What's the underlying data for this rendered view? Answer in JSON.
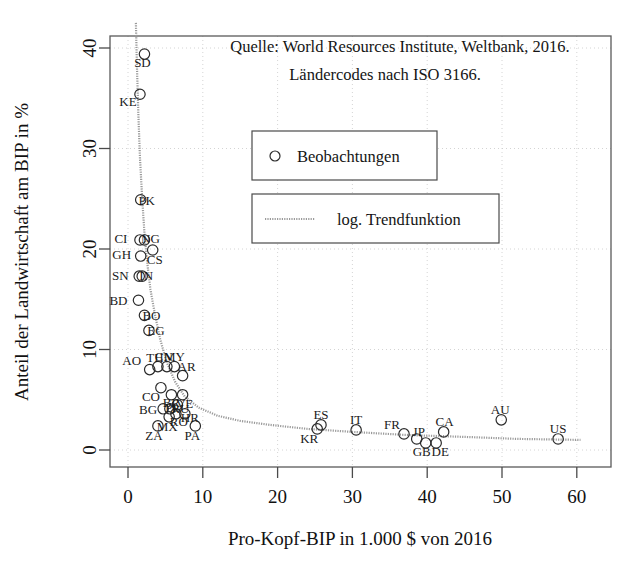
{
  "chart_data": {
    "type": "scatter",
    "title": "",
    "xlabel": "Pro-Kopf-BIP in 1.000 $ von 2016",
    "ylabel": "Anteil der Landwirtschaft am BIP in %",
    "xlim": [
      -1.5,
      62.5
    ],
    "ylim": [
      -2.5,
      42.5
    ],
    "xticks": [
      0,
      10,
      20,
      30,
      40,
      50,
      60
    ],
    "yticks": [
      0,
      10,
      20,
      30,
      40
    ],
    "grid": true,
    "legend_position": "upper-center",
    "annotations": [
      "Quelle: World Resources Institute, Weltbank, 2016.",
      "Ländercodes nach ISO 3166."
    ],
    "legend": [
      {
        "label": "Beobachtungen",
        "marker": "circle"
      },
      {
        "label": "log. Trendfunktion",
        "marker": "line"
      }
    ],
    "series": [
      {
        "name": "Beobachtungen",
        "points": [
          {
            "code": "SD",
            "x": 2.2,
            "y": 39.4,
            "lx": -2,
            "ly": 13
          },
          {
            "code": "KE",
            "x": 1.6,
            "y": 35.4,
            "lx": -12,
            "ly": 12
          },
          {
            "code": "PK",
            "x": 1.7,
            "y": 24.9,
            "lx": 6,
            "ly": 5
          },
          {
            "code": "CI",
            "x": 1.6,
            "y": 20.9,
            "lx": -19,
            "ly": 3
          },
          {
            "code": "NG",
            "x": 2.2,
            "y": 20.9,
            "lx": 6,
            "ly": 3
          },
          {
            "code": "CS",
            "x": 3.3,
            "y": 19.9,
            "lx": 2,
            "ly": 14
          },
          {
            "code": "GH",
            "x": 1.7,
            "y": 19.3,
            "lx": -19,
            "ly": 3
          },
          {
            "code": "SN",
            "x": 1.5,
            "y": 17.3,
            "lx": -19,
            "ly": 4
          },
          {
            "code": "IN",
            "x": 1.9,
            "y": 17.3,
            "lx": 4,
            "ly": 4
          },
          {
            "code": "BD",
            "x": 1.4,
            "y": 14.9,
            "lx": -20,
            "ly": 5
          },
          {
            "code": "BO",
            "x": 2.2,
            "y": 13.4,
            "lx": 7,
            "ly": 5
          },
          {
            "code": "EG",
            "x": 2.8,
            "y": 11.9,
            "lx": 7,
            "ly": 5
          },
          {
            "code": "AO",
            "x": 2.9,
            "y": 8.0,
            "lx": -18,
            "ly": -5
          },
          {
            "code": "TH",
            "x": 4.0,
            "y": 8.3,
            "lx": -3,
            "ly": -5
          },
          {
            "code": "CN",
            "x": 5.2,
            "y": 8.3,
            "lx": -3,
            "ly": -6
          },
          {
            "code": "MY",
            "x": 6.2,
            "y": 8.3,
            "lx": 0,
            "ly": -6
          },
          {
            "code": "AR",
            "x": 7.3,
            "y": 7.4,
            "lx": 4,
            "ly": -5
          },
          {
            "code": "CO",
            "x": 4.4,
            "y": 6.2,
            "lx": -10,
            "ly": 13
          },
          {
            "code": "BR",
            "x": 5.8,
            "y": 5.5,
            "lx": 0,
            "ly": 12
          },
          {
            "code": "VE",
            "x": 7.3,
            "y": 5.5,
            "lx": 2,
            "ly": 13
          },
          {
            "code": "RU",
            "x": 6.6,
            "y": 4.5,
            "lx": 3,
            "ly": 8
          },
          {
            "code": "BG",
            "x": 4.7,
            "y": 4.1,
            "lx": -15,
            "ly": 5
          },
          {
            "code": "PL",
            "x": 5.6,
            "y": 4.1,
            "lx": 3,
            "ly": 3
          },
          {
            "code": "RO",
            "x": 6.4,
            "y": 3.6,
            "lx": 3,
            "ly": 12
          },
          {
            "code": "MX",
            "x": 5.5,
            "y": 3.3,
            "lx": -2,
            "ly": 14
          },
          {
            "code": "HR",
            "x": 7.6,
            "y": 3.6,
            "lx": 5,
            "ly": 8
          },
          {
            "code": "ZA",
            "x": 4.0,
            "y": 2.4,
            "lx": -4,
            "ly": 14
          },
          {
            "code": "PA",
            "x": 9.0,
            "y": 2.4,
            "lx": -3,
            "ly": 14
          },
          {
            "code": "KR",
            "x": 25.3,
            "y": 2.1,
            "lx": -8,
            "ly": 14
          },
          {
            "code": "ES",
            "x": 25.8,
            "y": 2.5,
            "lx": 0,
            "ly": -6
          },
          {
            "code": "IT",
            "x": 30.5,
            "y": 2.0,
            "lx": 0,
            "ly": -6
          },
          {
            "code": "FR",
            "x": 36.9,
            "y": 1.6,
            "lx": -12,
            "ly": -5
          },
          {
            "code": "JP",
            "x": 38.6,
            "y": 1.1,
            "lx": 2,
            "ly": -3
          },
          {
            "code": "GB",
            "x": 39.8,
            "y": 0.7,
            "lx": -4,
            "ly": 13
          },
          {
            "code": "DE",
            "x": 41.2,
            "y": 0.7,
            "lx": 4,
            "ly": 13
          },
          {
            "code": "CA",
            "x": 42.2,
            "y": 1.8,
            "lx": 1,
            "ly": -6
          },
          {
            "code": "AU",
            "x": 49.9,
            "y": 3.0,
            "lx": -1,
            "ly": -6
          },
          {
            "code": "US",
            "x": 57.5,
            "y": 1.1,
            "lx": 0,
            "ly": -6
          }
        ]
      }
    ],
    "trend": {
      "name": "log. Trendfunktion",
      "form": "logarithmic",
      "points": [
        {
          "x": 1.05,
          "y": 42.5
        },
        {
          "x": 1.2,
          "y": 38.0
        },
        {
          "x": 1.4,
          "y": 33.0
        },
        {
          "x": 1.6,
          "y": 29.0
        },
        {
          "x": 1.9,
          "y": 25.0
        },
        {
          "x": 2.2,
          "y": 21.5
        },
        {
          "x": 2.6,
          "y": 18.5
        },
        {
          "x": 3.0,
          "y": 16.0
        },
        {
          "x": 3.6,
          "y": 13.5
        },
        {
          "x": 4.3,
          "y": 11.0
        },
        {
          "x": 5.2,
          "y": 8.7
        },
        {
          "x": 6.3,
          "y": 6.8
        },
        {
          "x": 7.6,
          "y": 5.3
        },
        {
          "x": 9.5,
          "y": 4.2
        },
        {
          "x": 12.0,
          "y": 3.4
        },
        {
          "x": 15.0,
          "y": 2.9
        },
        {
          "x": 19.0,
          "y": 2.5
        },
        {
          "x": 24.0,
          "y": 2.1
        },
        {
          "x": 30.0,
          "y": 1.8
        },
        {
          "x": 37.0,
          "y": 1.5
        },
        {
          "x": 45.0,
          "y": 1.3
        },
        {
          "x": 52.0,
          "y": 1.1
        },
        {
          "x": 60.5,
          "y": 1.0
        }
      ]
    }
  }
}
